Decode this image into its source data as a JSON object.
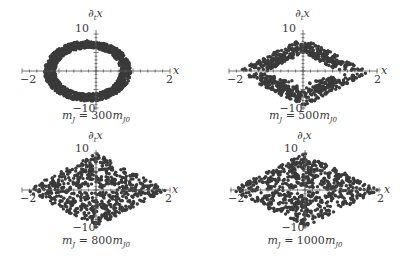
{
  "chart_data": [
    {
      "type": "scatter",
      "title": "m_J = 300m_J0",
      "caption_parts": {
        "m": "m",
        "sub": "J",
        "eq": " = 300",
        "m2": "m",
        "sub2": "J0"
      },
      "xlabel": "x",
      "ylabel": "∂_t x",
      "xlim": [
        -2,
        2
      ],
      "ylim": [
        -10,
        10
      ],
      "xticks": [
        "-2",
        "1",
        "2"
      ],
      "yticks": [
        "10",
        "5",
        "-5",
        "-10"
      ],
      "shape": "ring",
      "description": "dense elliptical ring centered slightly left, x in [-1.4, 1.0], y in [-8, 8]",
      "params": {
        "cx": -0.2,
        "rx": 1.2,
        "ry": 8.2,
        "thick": 0.28,
        "n": 1400,
        "seed": 3
      }
    },
    {
      "type": "scatter",
      "title": "m_J = 500m_J0",
      "caption_parts": {
        "m": "m",
        "sub": "J",
        "eq": " = 500",
        "m2": "m",
        "sub2": "J0"
      },
      "xlabel": "x",
      "ylabel": "∂_t x",
      "xlim": [
        -2,
        2
      ],
      "ylim": [
        -10,
        10
      ],
      "xticks": [
        "-2",
        "2"
      ],
      "yticks": [
        "10",
        "5",
        "-10"
      ],
      "shape": "diamond-ring",
      "description": "diamond-shaped band with hollow center, x in [-1.8, 1.7]",
      "params": {
        "cx": 0.0,
        "rx": 1.75,
        "ry": 9.5,
        "thick": 0.45,
        "n": 700,
        "seed": 11
      }
    },
    {
      "type": "scatter",
      "title": "m_J = 800m_J0",
      "caption_parts": {
        "m": "m",
        "sub": "J",
        "eq": " = 800",
        "m2": "m",
        "sub2": "J0"
      },
      "xlabel": "x",
      "ylabel": "∂_t x",
      "xlim": [
        -2,
        2
      ],
      "ylim": [
        -10,
        10
      ],
      "xticks": [
        "-2",
        "2"
      ],
      "yticks": [
        "10",
        "-10"
      ],
      "shape": "diamond-filled",
      "description": "filled diamond scatter, x in [-1.9, 1.9], y in [-10, 10]",
      "params": {
        "cx": 0.0,
        "rx": 1.9,
        "ry": 10,
        "thick": 1.0,
        "n": 650,
        "seed": 23
      }
    },
    {
      "type": "scatter",
      "title": "m_J = 1000m_J0",
      "caption_parts": {
        "m": "m",
        "sub": "J",
        "eq": " = 1000",
        "m2": "m",
        "sub2": "J0"
      },
      "xlabel": "x",
      "ylabel": "∂_t x",
      "xlim": [
        -2,
        2
      ],
      "ylim": [
        -10,
        10
      ],
      "xticks": [
        "-2",
        "2"
      ],
      "yticks": [
        "10",
        "-10"
      ],
      "shape": "diamond-filled",
      "description": "filled diamond scatter, slightly wider, x in [-2, 2], y in [-10, 10]",
      "params": {
        "cx": 0.0,
        "rx": 2.0,
        "ry": 10,
        "thick": 1.0,
        "n": 700,
        "seed": 41
      }
    }
  ],
  "panels": [
    {
      "ox": 96,
      "oy": 71,
      "sx": 37,
      "sy": 3.7,
      "xl": 22,
      "xr": 170,
      "ytop": 30,
      "ybot": 110,
      "title_y": 119,
      "ylabel_y": 17
    },
    {
      "ox": 303,
      "oy": 71,
      "sx": 37,
      "sy": 3.7,
      "xl": 229,
      "xr": 378,
      "ytop": 30,
      "ybot": 110,
      "title_y": 119,
      "ylabel_y": 17
    },
    {
      "ox": 96,
      "oy": 190,
      "sx": 37,
      "sy": 3.7,
      "xl": 22,
      "xr": 169,
      "ytop": 150,
      "ybot": 229,
      "title_y": 244,
      "ylabel_y": 139
    },
    {
      "ox": 305,
      "oy": 190,
      "sx": 37,
      "sy": 3.7,
      "xl": 230,
      "xr": 381,
      "ytop": 150,
      "ybot": 229,
      "title_y": 244,
      "ylabel_y": 139
    }
  ],
  "colors": {
    "dots": "#3a3a3a",
    "axis": "#555555",
    "text": "#3a3a3a",
    "background": "#ffffff"
  }
}
